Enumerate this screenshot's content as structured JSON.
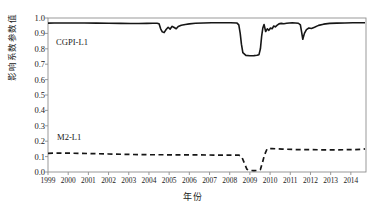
{
  "chart_data": {
    "type": "line",
    "title": "",
    "subtitle": "",
    "xlabel": "年份",
    "ylabel": "影响系数参数值",
    "xlim": [
      1999,
      2014.75
    ],
    "ylim": [
      0.0,
      1.0
    ],
    "grid": false,
    "legend_position": "inline-annotation",
    "y_ticks": [
      "1.0",
      "0.9",
      "0.8",
      "0.7",
      "0.6",
      "0.5",
      "0.4",
      "0.3",
      "0.2",
      "0.1",
      "0.0"
    ],
    "y_tick_values": [
      1.0,
      0.9,
      0.8,
      0.7,
      0.6,
      0.5,
      0.4,
      0.3,
      0.2,
      0.1,
      0.0
    ],
    "x_ticks": [
      "1999",
      "2000",
      "2001",
      "2002",
      "2003",
      "2004",
      "2005",
      "2006",
      "2007",
      "2008",
      "2009",
      "2010",
      "2011",
      "2012",
      "2013",
      "2014"
    ],
    "x_tick_values": [
      1999,
      2000,
      2001,
      2002,
      2003,
      2004,
      2005,
      2006,
      2007,
      2008,
      2009,
      2010,
      2011,
      2012,
      2013,
      2014
    ],
    "annotations": [
      {
        "text": "CGPI-L1",
        "x": 1999.4,
        "y": 0.895
      },
      {
        "text": "M2-L1",
        "x": 1999.5,
        "y": 0.205
      }
    ],
    "series": [
      {
        "name": "CGPI-L1",
        "style": "solid",
        "color": "#161616",
        "width": 1.6,
        "x": [
          1999.0,
          1999.3,
          1999.7,
          2000.2,
          2000.8,
          2001.4,
          2002.0,
          2002.6,
          2003.1,
          2003.5,
          2003.9,
          2004.2,
          2004.4,
          2004.5,
          2004.58,
          2004.66,
          2004.75,
          2004.85,
          2004.95,
          2005.05,
          2005.15,
          2005.25,
          2005.35,
          2005.45,
          2005.6,
          2005.8,
          2006.0,
          2006.3,
          2006.7,
          2007.1,
          2007.6,
          2008.05,
          2008.35,
          2008.45,
          2008.52,
          2008.58,
          2008.65,
          2008.8,
          2009.0,
          2009.2,
          2009.35,
          2009.45,
          2009.52,
          2009.58,
          2009.64,
          2009.7,
          2009.78,
          2009.86,
          2009.94,
          2010.02,
          2010.1,
          2010.18,
          2010.26,
          2010.34,
          2010.44,
          2010.55,
          2010.68,
          2010.82,
          2010.95,
          2011.1,
          2011.25,
          2011.4,
          2011.5,
          2011.56,
          2011.62,
          2011.7,
          2011.8,
          2011.92,
          2012.05,
          2012.2,
          2012.4,
          2012.65,
          2012.95,
          2013.3,
          2013.7,
          2014.1,
          2014.45,
          2014.7
        ],
        "y": [
          0.967,
          0.968,
          0.968,
          0.968,
          0.968,
          0.967,
          0.966,
          0.965,
          0.964,
          0.964,
          0.965,
          0.966,
          0.966,
          0.963,
          0.93,
          0.91,
          0.905,
          0.925,
          0.94,
          0.928,
          0.946,
          0.938,
          0.93,
          0.945,
          0.953,
          0.958,
          0.962,
          0.966,
          0.968,
          0.969,
          0.969,
          0.969,
          0.968,
          0.955,
          0.9,
          0.83,
          0.775,
          0.757,
          0.755,
          0.756,
          0.758,
          0.762,
          0.8,
          0.88,
          0.935,
          0.958,
          0.912,
          0.93,
          0.92,
          0.935,
          0.93,
          0.948,
          0.942,
          0.952,
          0.962,
          0.965,
          0.963,
          0.966,
          0.968,
          0.969,
          0.968,
          0.966,
          0.955,
          0.91,
          0.862,
          0.9,
          0.925,
          0.935,
          0.932,
          0.94,
          0.952,
          0.96,
          0.965,
          0.967,
          0.968,
          0.969,
          0.969,
          0.969
        ]
      },
      {
        "name": "M2-L1",
        "style": "dashed",
        "color": "#161616",
        "width": 1.7,
        "dasharray": "5,3.5",
        "x": [
          1999.0,
          1999.5,
          2000.2,
          2001.0,
          2002.0,
          2003.0,
          2003.6,
          2004.0,
          2004.4,
          2004.8,
          2005.3,
          2005.9,
          2006.5,
          2007.2,
          2008.0,
          2008.45,
          2008.6,
          2008.72,
          2008.85,
          2009.0,
          2009.2,
          2009.4,
          2009.52,
          2009.62,
          2009.72,
          2009.85,
          2010.1,
          2010.6,
          2011.2,
          2011.9,
          2012.6,
          2013.3,
          2014.0,
          2014.55,
          2014.7
        ],
        "y": [
          0.121,
          0.123,
          0.122,
          0.12,
          0.117,
          0.114,
          0.113,
          0.112,
          0.112,
          0.112,
          0.111,
          0.111,
          0.111,
          0.11,
          0.11,
          0.11,
          0.098,
          0.06,
          0.018,
          0.01,
          0.009,
          0.01,
          0.016,
          0.06,
          0.11,
          0.15,
          0.152,
          0.149,
          0.146,
          0.145,
          0.144,
          0.144,
          0.145,
          0.147,
          0.15
        ]
      }
    ]
  },
  "axes": {
    "frame_color": "#8f8f8f"
  }
}
